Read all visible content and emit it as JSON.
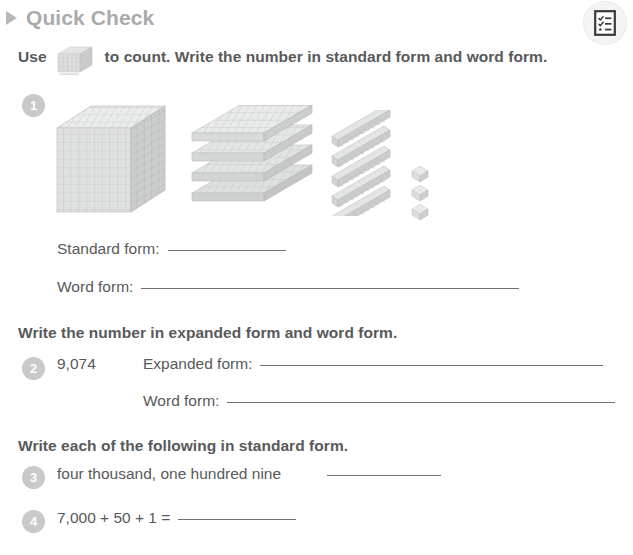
{
  "header": {
    "title": "Quick Check",
    "marker_icon": "triangle-right-icon",
    "accent_color": "#a8aaac"
  },
  "toolbar": {
    "checklist_button_icon": "checklist-document-icon"
  },
  "instructions": {
    "top": {
      "before_icon": "Use",
      "icon": "base-ten-thousand-cube-icon",
      "after_icon": "to count. Write the number in standard form and word form."
    },
    "second": "Write the number in expanded form and word form.",
    "third": "Write each of the following in standard form."
  },
  "questions": [
    {
      "number": "1",
      "manipulatives": {
        "thousands_cubes": 1,
        "hundreds_flats": 4,
        "tens_rods": 5,
        "ones_units": 3
      },
      "fields": [
        {
          "label": "Standard form:",
          "value": "",
          "line_width": 118
        },
        {
          "label": "Word form:",
          "value": "",
          "line_width": 378
        }
      ]
    },
    {
      "number": "2",
      "prompt": "9,074",
      "fields": [
        {
          "label": "Expanded form:",
          "value": "",
          "line_width": 343
        },
        {
          "label": "Word form:",
          "value": "",
          "line_width": 388
        }
      ]
    },
    {
      "number": "3",
      "prompt": "four thousand, one hundred nine",
      "answer_line_width": 114
    },
    {
      "number": "4",
      "prompt": "7,000 + 50 + 1 =",
      "answer_line_width": 118
    }
  ],
  "colors": {
    "text": "#58595b",
    "badge_fill": "#c7c9cb",
    "rule": "#6f7072",
    "block_light": "#e9eaea",
    "block_mid": "#d6d8d8",
    "block_dark": "#c2c4c4"
  }
}
